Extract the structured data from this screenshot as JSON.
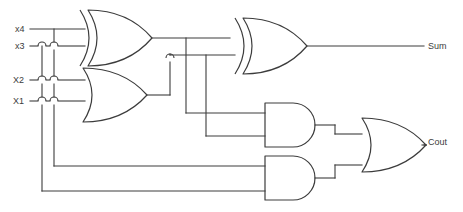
{
  "diagram": {
    "type": "logic-circuit-schematic",
    "background_color": "#ffffff",
    "line_color": "#3c3c3c"
  },
  "inputs": [
    {
      "id": "x4",
      "label": "x4",
      "y": 29
    },
    {
      "id": "x3",
      "label": "x3",
      "y": 46
    },
    {
      "id": "X2",
      "label": "X2",
      "y": 80
    },
    {
      "id": "X1",
      "label": "X1",
      "y": 101
    }
  ],
  "outputs": [
    {
      "id": "sum",
      "label": "Sum",
      "y": 46
    },
    {
      "id": "cout",
      "label": "Cout",
      "y": 143
    }
  ],
  "gates": [
    {
      "id": "xor1",
      "type": "XOR",
      "inputs": [
        "x4",
        "x3"
      ],
      "output": "xor1_out"
    },
    {
      "id": "or1",
      "type": "OR",
      "inputs": [
        "X2",
        "X1"
      ],
      "output": "or1_out"
    },
    {
      "id": "xor2",
      "type": "XOR",
      "inputs": [
        "xor1_out",
        "or1_out"
      ],
      "output": "Sum"
    },
    {
      "id": "and1",
      "type": "AND",
      "inputs": [
        "xor1_out",
        "or1_out"
      ],
      "output": "and1_out"
    },
    {
      "id": "and2",
      "type": "AND",
      "inputs": [
        "x4",
        "x3"
      ],
      "output": "and2_out"
    },
    {
      "id": "or2",
      "type": "OR",
      "inputs": [
        "and1_out",
        "and2_out"
      ],
      "output": "Cout"
    }
  ],
  "wire_hops": [
    {
      "x": 42,
      "y": 46
    },
    {
      "x": 54,
      "y": 46
    },
    {
      "x": 42,
      "y": 80
    },
    {
      "x": 54,
      "y": 80
    },
    {
      "x": 42,
      "y": 101
    },
    {
      "x": 54,
      "y": 101
    },
    {
      "x": 170,
      "y": 58
    },
    {
      "x": 193,
      "y": 113
    }
  ]
}
